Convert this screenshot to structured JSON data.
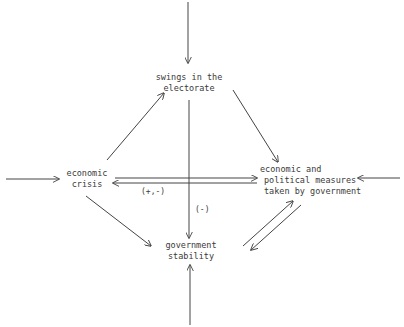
{
  "diagram": {
    "nodes": {
      "electorate": {
        "lines": [
          "swings in the",
          "electorate"
        ]
      },
      "crisis": {
        "lines": [
          "economic",
          "crisis"
        ]
      },
      "measures": {
        "lines": [
          "economic and",
          "political measures",
          "taken by government"
        ]
      },
      "stability": {
        "lines": [
          "government",
          "stability"
        ]
      }
    },
    "edge_labels": {
      "crisis_measures": "(+,-)",
      "electorate_stability": "(-)"
    },
    "edges": [
      {
        "from": "external-top",
        "to": "electorate"
      },
      {
        "from": "external-left",
        "to": "crisis"
      },
      {
        "from": "external-right",
        "to": "measures"
      },
      {
        "from": "external-bottom",
        "to": "stability"
      },
      {
        "from": "crisis",
        "to": "electorate"
      },
      {
        "from": "electorate",
        "to": "measures"
      },
      {
        "from": "crisis",
        "to": "measures"
      },
      {
        "from": "measures",
        "to": "crisis",
        "label": "(+,-)"
      },
      {
        "from": "electorate",
        "to": "stability",
        "label": "(-)"
      },
      {
        "from": "crisis",
        "to": "stability"
      },
      {
        "from": "stability",
        "to": "measures"
      },
      {
        "from": "measures",
        "to": "stability"
      }
    ],
    "colors": {
      "line": "#444444",
      "text": "#3a3a3a",
      "background": "#ffffff"
    }
  }
}
